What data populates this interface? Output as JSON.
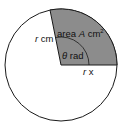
{
  "diagram": {
    "type": "circle-sector",
    "circle": {
      "cx": 61,
      "cy": 65,
      "r": 56
    },
    "sector": {
      "start_point": [
        117,
        65
      ],
      "end_point": [
        50,
        10
      ],
      "fill": "#8c8c8c"
    },
    "angle_arc": {
      "r": 28
    },
    "labels": {
      "area_prefix": "area ",
      "area_var": "A",
      "area_unit": " cm",
      "area_exp": "2",
      "radius_left_var": "r",
      "radius_left_unit": " cm",
      "angle_var": "θ",
      "angle_unit": " rad",
      "radius_bottom_var": "r",
      "radius_bottom_unit": " x"
    },
    "colors": {
      "stroke": "#1a1a1a",
      "sector_fill": "#8c8c8c",
      "background": "#ffffff"
    }
  }
}
